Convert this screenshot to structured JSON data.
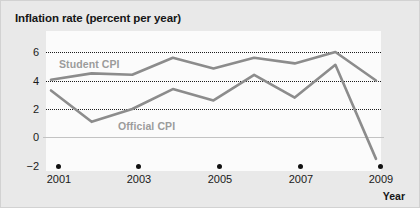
{
  "chart_data": {
    "type": "line",
    "title": "Inflation rate (percent per year)",
    "xlabel": "Year",
    "ylabel": "",
    "x": [
      2001,
      2002,
      2003,
      2004,
      2005,
      2006,
      2007,
      2008,
      2009
    ],
    "xticks": [
      "2001",
      "2003",
      "2005",
      "2007",
      "2009"
    ],
    "xtick_values": [
      2001,
      2003,
      2005,
      2007,
      2009
    ],
    "yticks": [
      "−2",
      "0",
      "2",
      "4",
      "6"
    ],
    "ytick_values": [
      -2,
      0,
      2,
      4,
      6
    ],
    "xlim": [
      2001,
      2009
    ],
    "ylim": [
      -2,
      6.8
    ],
    "grid": "horizontal-dotted at 2, 4, 6; solid gray line at 0",
    "legend_position": "inline-labels",
    "series": [
      {
        "name": "Student CPI",
        "color": "#8c8c8c",
        "values": [
          4.05,
          4.5,
          4.4,
          5.6,
          4.85,
          5.6,
          5.2,
          6.0,
          4.0
        ],
        "label_text": "Student CPI"
      },
      {
        "name": "Official CPI",
        "color": "#8c8c8c",
        "values": [
          3.3,
          1.1,
          2.0,
          3.4,
          2.6,
          4.4,
          2.8,
          5.1,
          -1.5
        ],
        "label_text": "Official CPI"
      }
    ],
    "colors": {
      "line": "#8c8c8c",
      "label": "#9b9b9b",
      "grid": "#1d1d1d",
      "zero_axis": "#c3c3c3",
      "plot_background": "#fbfbfb",
      "figure_background": "#e9e9e9",
      "text": "#161616"
    }
  },
  "annotations": {
    "student_cpi_label": "Student CPI",
    "official_cpi_label": "Official CPI"
  }
}
